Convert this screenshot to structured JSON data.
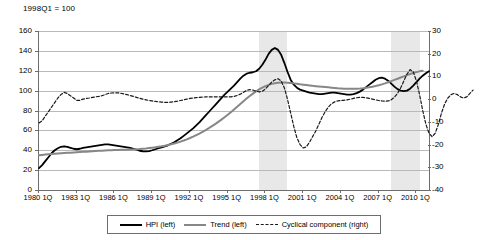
{
  "chart_data": {
    "type": "line",
    "title": "1998Q1 = 100",
    "xlabel": "",
    "ylabel": "",
    "grid": true,
    "legend_position": "bottom",
    "y_left": {
      "label": "Index (1998Q1 = 100)",
      "min": 0,
      "max": 160,
      "ticks": [
        "0",
        "20",
        "40",
        "60",
        "80",
        "100",
        "120",
        "140",
        "160"
      ]
    },
    "y_right": {
      "label": "Percent deviation from trend",
      "min": -40,
      "max": 30,
      "ticks": [
        "30",
        "20",
        "10",
        "0",
        "-10",
        "-20",
        "-30",
        "-40"
      ]
    },
    "x_ticks": [
      "1980 1Q",
      "1983 1Q",
      "1986 1Q",
      "1989 1Q",
      "1992 1Q",
      "1995 1Q",
      "1998 1Q",
      "2001 1Q",
      "2004 1Q",
      "2007 1Q",
      "2010 1Q"
    ],
    "x_start": "1980 1Q",
    "x_end": "2011 4Q",
    "shaded_bands": [
      {
        "label": "crisis-band-1",
        "from": "1997 3Q",
        "to": "1999 4Q",
        "color": "#e8e8e8"
      },
      {
        "label": "crisis-band-2",
        "from": "2008 1Q",
        "to": "2010 2Q",
        "color": "#e8e8e8"
      }
    ],
    "series": [
      {
        "name": "HPI (left)",
        "axis": "left",
        "color": "#000000",
        "style": "solid",
        "values": [
          22,
          25,
          29,
          33,
          37,
          40,
          42,
          43.5,
          44,
          43.5,
          42.5,
          41.5,
          41,
          41.5,
          42.5,
          43,
          43.5,
          44,
          44.5,
          45,
          45.5,
          46,
          46,
          45.5,
          45,
          44.5,
          44,
          43.5,
          43,
          42.5,
          41.5,
          40.5,
          39.5,
          39,
          38.8,
          39.2,
          40,
          41,
          42,
          43,
          44,
          45,
          46.5,
          48,
          50,
          52,
          54.5,
          57,
          59.5,
          62,
          65,
          68,
          71.5,
          75,
          78.5,
          82,
          85.5,
          89,
          92.5,
          96,
          99,
          102,
          105,
          108.5,
          112,
          115,
          117,
          118,
          118.5,
          119.5,
          122,
          126,
          131,
          137,
          141,
          143,
          141,
          136,
          128,
          119,
          111,
          106,
          103,
          101,
          100,
          99,
          98,
          97.5,
          97,
          96.5,
          96.5,
          97,
          97.5,
          98,
          98,
          97.5,
          97,
          96.5,
          96,
          96,
          96.5,
          97.5,
          99,
          101,
          103.5,
          106,
          108.5,
          111,
          112.5,
          113,
          112,
          110,
          107,
          104,
          101.5,
          100,
          99.5,
          100,
          102,
          105,
          108.5,
          112,
          115,
          117.5,
          119.5
        ]
      },
      {
        "name": "Trend (left)",
        "axis": "left",
        "color": "#878787",
        "style": "solid",
        "values": [
          35,
          35.3,
          35.6,
          35.9,
          36.2,
          36.5,
          36.8,
          37,
          37.2,
          37.4,
          37.6,
          37.8,
          38,
          38.2,
          38.4,
          38.6,
          38.8,
          39,
          39.2,
          39.4,
          39.6,
          39.8,
          40,
          40.1,
          40.2,
          40.3,
          40.4,
          40.5,
          40.6,
          40.7,
          40.8,
          41,
          41.2,
          41.5,
          41.8,
          42.2,
          42.6,
          43,
          43.5,
          44,
          44.6,
          45.3,
          46,
          46.8,
          47.7,
          48.7,
          49.8,
          51,
          52.3,
          53.7,
          55.2,
          56.8,
          58.5,
          60.3,
          62.2,
          64.2,
          66.3,
          68.5,
          70.8,
          73.2,
          75.7,
          78.3,
          81,
          83.7,
          86.5,
          89.3,
          92,
          94.6,
          97,
          99.2,
          101.2,
          103,
          104.5,
          105.8,
          106.8,
          107.5,
          108,
          108.2,
          108.2,
          108,
          107.7,
          107.3,
          106.9,
          106.4,
          106,
          105.6,
          105.2,
          104.8,
          104.5,
          104.2,
          103.9,
          103.6,
          103.3,
          103,
          102.7,
          102.4,
          102.2,
          102,
          101.9,
          101.8,
          101.8,
          101.9,
          102.1,
          102.4,
          102.8,
          103.3,
          103.9,
          104.6,
          105.4,
          106.3,
          107.3,
          108.4,
          109.6,
          110.8,
          112,
          113.2,
          114.4,
          115.6,
          116.7,
          117.7,
          118.6,
          119.4,
          120
        ]
      },
      {
        "name": "Cyclical component (right)",
        "axis": "right",
        "color": "#1a1a1a",
        "style": "dashed",
        "values": [
          -10.5,
          -9.5,
          -7.5,
          -5.5,
          -3.5,
          -1.5,
          0.5,
          2,
          3,
          2.5,
          1.5,
          0.5,
          -0.5,
          -0.5,
          0,
          0.3,
          0.5,
          0.8,
          1,
          1.2,
          1.5,
          2,
          2.5,
          2.7,
          2.8,
          2.8,
          2.6,
          2.3,
          2,
          1.6,
          1.2,
          0.8,
          0.4,
          0,
          -0.3,
          -0.6,
          -0.8,
          -1,
          -1.2,
          -1.3,
          -1.4,
          -1.4,
          -1.3,
          -1.1,
          -0.9,
          -0.6,
          -0.3,
          0,
          0.3,
          0.5,
          0.7,
          0.8,
          0.9,
          1,
          1,
          1,
          1,
          1,
          1,
          1,
          1,
          1,
          1.2,
          1.6,
          2.2,
          3,
          3.8,
          4.2,
          4,
          3.5,
          3.2,
          3.5,
          4.5,
          6,
          7.5,
          8.5,
          9,
          8,
          5,
          0,
          -6,
          -12,
          -17,
          -20,
          -21.5,
          -21,
          -19,
          -16.5,
          -14,
          -11,
          -8,
          -5.5,
          -3.5,
          -2,
          -1.2,
          -0.8,
          -0.6,
          -0.5,
          -0.3,
          0,
          0.3,
          0.6,
          0.8,
          0.8,
          0.6,
          0.3,
          0,
          -0.3,
          -0.6,
          -0.8,
          -0.9,
          -0.8,
          -0.3,
          0.8,
          2.5,
          5,
          8,
          11,
          13,
          12,
          8,
          2,
          -5,
          -11,
          -15,
          -16.5,
          -15,
          -11,
          -6,
          -2,
          0.5,
          2,
          2.5,
          2,
          1,
          0.5,
          1,
          2.5,
          4
        ]
      }
    ]
  },
  "legend": {
    "items": [
      {
        "label": "HPI (left)",
        "style": "solid-black"
      },
      {
        "label": "Trend (left)",
        "style": "solid-gray"
      },
      {
        "label": "Cyclical component (right)",
        "style": "dashed-black"
      }
    ]
  }
}
